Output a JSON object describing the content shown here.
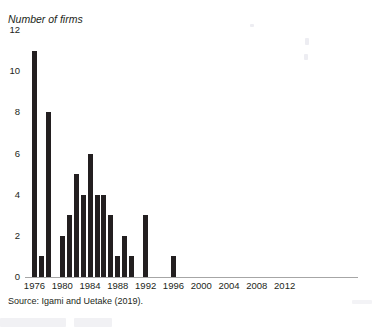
{
  "figure": {
    "cut_off_title": "",
    "y_axis_title": "Number of firms",
    "source_note": "Source: Igami and Uetake (2019)."
  },
  "chart_data": {
    "type": "bar",
    "title": "",
    "xlabel": "",
    "ylabel": "Number of firms",
    "ylim": [
      0,
      12
    ],
    "xlim": [
      1975,
      2013
    ],
    "ytick_values": [
      0,
      2,
      4,
      6,
      8,
      10,
      12
    ],
    "ytick_labels": [
      "0",
      "2",
      "4",
      "6",
      "8",
      "10",
      "12"
    ],
    "xtick_values": [
      1976,
      1980,
      1984,
      1988,
      1992,
      1996,
      2000,
      2004,
      2008,
      2012
    ],
    "xtick_labels": [
      "1976",
      "1980",
      "1984",
      "1988",
      "1992",
      "1996",
      "2000",
      "2004",
      "2008",
      "2012"
    ],
    "grid": false,
    "legend": "none",
    "bar_color": "#231f20",
    "categories": [
      1976,
      1977,
      1978,
      1979,
      1980,
      1981,
      1982,
      1983,
      1984,
      1985,
      1986,
      1987,
      1988,
      1989,
      1990,
      1991,
      1992,
      1993,
      1994,
      1995,
      1996,
      1997,
      1998,
      1999,
      2000,
      2001,
      2002,
      2003,
      2004,
      2005,
      2006,
      2007,
      2008,
      2009,
      2010,
      2011,
      2012
    ],
    "values": [
      11,
      1,
      8,
      0,
      2,
      3,
      5,
      4,
      6,
      4,
      4,
      3,
      1,
      2,
      1,
      0,
      3,
      0,
      0,
      0,
      1,
      0,
      0,
      0,
      0,
      0,
      0,
      0,
      0,
      0,
      0,
      0,
      0,
      0,
      0,
      0,
      0
    ]
  }
}
